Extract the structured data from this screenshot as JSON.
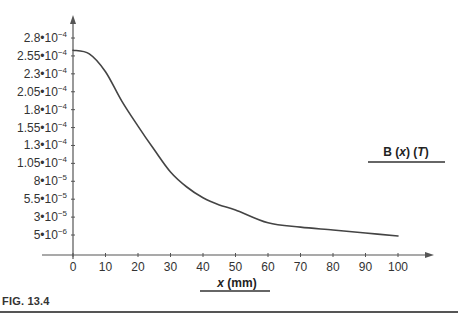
{
  "figure": {
    "caption": "FIG. 13.4"
  },
  "chart_data": {
    "type": "line",
    "title": "",
    "xlabel": "x (mm)",
    "ylabel": "B (x) (T)",
    "xlim": [
      0,
      100
    ],
    "ylim": [
      0,
      0.00028
    ],
    "grid": false,
    "legend": null,
    "x_ticks": [
      0,
      10,
      20,
      30,
      40,
      50,
      60,
      70,
      80,
      90,
      100
    ],
    "x_tick_labels": [
      "0",
      "10",
      "20",
      "30",
      "40",
      "50",
      "60",
      "70",
      "80",
      "90",
      "100"
    ],
    "y_ticks": [
      0.00028,
      0.000255,
      0.00023,
      0.000205,
      0.00018,
      0.000155,
      0.00013,
      0.000105,
      8e-05,
      5.5e-05,
      3e-05,
      5e-06
    ],
    "y_tick_labels": [
      {
        "mantissa": "2.8",
        "exp": "−4"
      },
      {
        "mantissa": "2.55",
        "exp": "−4"
      },
      {
        "mantissa": "2.3",
        "exp": "−4"
      },
      {
        "mantissa": "2.05",
        "exp": "−4"
      },
      {
        "mantissa": "1.8",
        "exp": "−4"
      },
      {
        "mantissa": "1.55",
        "exp": "−4"
      },
      {
        "mantissa": "1.3",
        "exp": "−4"
      },
      {
        "mantissa": "1.05",
        "exp": "−4"
      },
      {
        "mantissa": "8",
        "exp": "−5"
      },
      {
        "mantissa": "5.5",
        "exp": "−5"
      },
      {
        "mantissa": "3",
        "exp": "−5"
      },
      {
        "mantissa": "5",
        "exp": "−6"
      }
    ],
    "series": [
      {
        "name": "B (x) (T)",
        "color": "#444444",
        "x": [
          0,
          5,
          10,
          15,
          20,
          25,
          30,
          35,
          40,
          45,
          50,
          60,
          70,
          80,
          90,
          100
        ],
        "values": [
          0.000263,
          0.000258,
          0.000233,
          0.000192,
          0.000157,
          0.000124,
          9.3e-05,
          7.2e-05,
          5.7e-05,
          4.7e-05,
          4e-05,
          2.2e-05,
          1.6e-05,
          1.2e-05,
          7.8e-06,
          3.6e-06
        ]
      }
    ]
  }
}
